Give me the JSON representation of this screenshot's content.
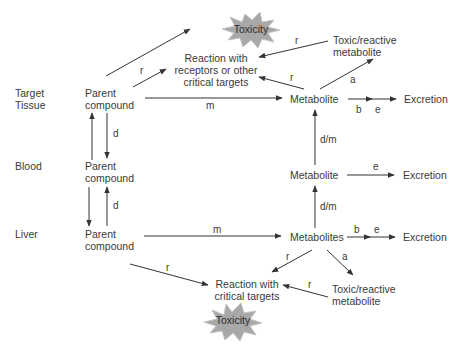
{
  "compartments": [
    {
      "id": "target",
      "label_line1": "Target",
      "label_line2": "Tissue"
    },
    {
      "id": "blood",
      "label_line1": "Blood",
      "label_line2": ""
    },
    {
      "id": "liver",
      "label_line1": "Liver",
      "label_line2": ""
    }
  ],
  "nodes": {
    "parent_target": {
      "line1": "Parent",
      "line2": "compound"
    },
    "parent_blood": {
      "line1": "Parent",
      "line2": "compound"
    },
    "parent_liver": {
      "line1": "Parent",
      "line2": "compound"
    },
    "metabolite_target": "Metabolite",
    "metabolite_blood": "Metabolite",
    "metabolites_liver": "Metabolites",
    "excretion_target": "Excretion",
    "excretion_blood": "Excretion",
    "excretion_liver": "Excretion",
    "reaction_top": {
      "line1": "Reaction with",
      "line2": "receptors or other",
      "line3": "critical targets"
    },
    "reaction_bottom": {
      "line1": "Reaction with",
      "line2": "critical targets"
    },
    "toxic_top": {
      "line1": "Toxic/reactive",
      "line2": "metabolite"
    },
    "toxic_bottom": {
      "line1": "Toxic/reactive",
      "line2": "metabolite"
    },
    "toxicity_top": "Toxicity",
    "toxicity_bottom": "Toxicity"
  },
  "edge_labels": {
    "r": "r",
    "m": "m",
    "d": "d",
    "a": "a",
    "b": "b",
    "e": "e",
    "dm": "d/m"
  },
  "colors": {
    "line": "#333333",
    "burst_fill": "#a9a9a9",
    "burst_stroke": "#bdbdbd",
    "text": "#3a3a3a"
  }
}
